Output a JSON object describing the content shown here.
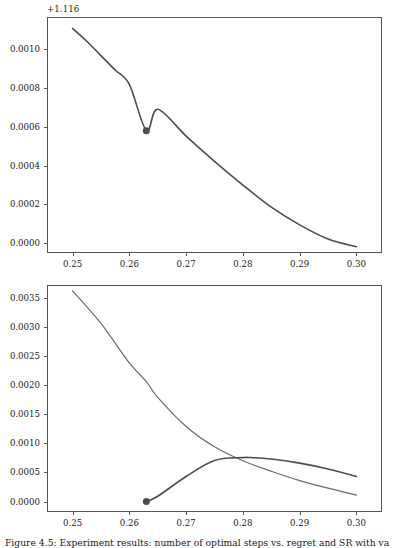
{
  "figure": {
    "caption": "Figure 4.5:  Experiment results: number of optimal steps vs. regret and SR with varying"
  },
  "chart_data": [
    {
      "id": "top-panel",
      "type": "line",
      "title": "",
      "xlabel": "",
      "ylabel": "",
      "y_offset_label": "+1.116",
      "y_offset_value": 1.116,
      "xlim": [
        0.2455,
        0.3045
      ],
      "ylim": [
        -5e-05,
        0.001165
      ],
      "grid": false,
      "legend": "none",
      "xticks": [
        0.25,
        0.26,
        0.27,
        0.28,
        0.29,
        0.3
      ],
      "xticklabels": [
        "0.25",
        "0.26",
        "0.27",
        "0.28",
        "0.29",
        "0.30"
      ],
      "yticks": [
        0.0,
        0.0002,
        0.0004,
        0.0006,
        0.0008,
        0.001
      ],
      "yticklabels": [
        "0.0000",
        "0.0002",
        "0.0004",
        "0.0006",
        "0.0008",
        "0.0010"
      ],
      "series": [
        {
          "name": "curve-1",
          "color": "#4d4d4d",
          "linewidth": 1.6,
          "x": [
            0.25,
            0.2525,
            0.255,
            0.2575,
            0.26,
            0.263,
            0.265,
            0.27,
            0.275,
            0.28,
            0.285,
            0.29,
            0.295,
            0.3
          ],
          "y": [
            0.001106,
            0.00104,
            0.000966,
            0.000892,
            0.000818,
            0.00058,
            0.00069,
            0.000552,
            0.000422,
            0.0003,
            0.000186,
            9.5e-05,
            2.2e-05,
            -1.8e-05
          ]
        }
      ],
      "markers": [
        {
          "name": "highlight-point",
          "x": 0.263,
          "y": 0.00058,
          "color": "#4d4d4d",
          "size": 7
        }
      ]
    },
    {
      "id": "bottom-panel",
      "type": "line",
      "title": "",
      "xlabel": "",
      "ylabel": "",
      "xlim": [
        0.2455,
        0.3045
      ],
      "ylim": [
        -0.00018,
        0.00372
      ],
      "grid": false,
      "legend": "none",
      "xticks": [
        0.25,
        0.26,
        0.27,
        0.28,
        0.29,
        0.3
      ],
      "xticklabels": [
        "0.25",
        "0.26",
        "0.27",
        "0.28",
        "0.29",
        "0.30"
      ],
      "yticks": [
        0.0,
        0.0005,
        0.001,
        0.0015,
        0.002,
        0.0025,
        0.003,
        0.0035
      ],
      "yticklabels": [
        "0.0000",
        "0.0005",
        "0.0010",
        "0.0015",
        "0.0020",
        "0.0025",
        "0.0030",
        "0.0035"
      ],
      "series": [
        {
          "name": "decreasing-curve",
          "color": "#6b6b6b",
          "linewidth": 1.2,
          "x": [
            0.25,
            0.255,
            0.26,
            0.263,
            0.265,
            0.27,
            0.275,
            0.28,
            0.285,
            0.29,
            0.295,
            0.3
          ],
          "y": [
            0.00362,
            0.00306,
            0.00238,
            0.00206,
            0.00179,
            0.00129,
            0.00094,
            0.0007,
            0.00052,
            0.00036,
            0.00023,
            0.00011
          ]
        },
        {
          "name": "rising-peaking-curve",
          "color": "#4d4d4d",
          "linewidth": 1.6,
          "x": [
            0.263,
            0.265,
            0.27,
            0.275,
            0.28,
            0.281,
            0.285,
            0.29,
            0.295,
            0.3
          ],
          "y": [
            0.0,
            9e-05,
            0.00043,
            0.000705,
            0.000755,
            0.000757,
            0.00073,
            0.00066,
            0.00056,
            0.00043
          ]
        }
      ],
      "markers": [
        {
          "name": "start-point",
          "x": 0.263,
          "y": 0.0,
          "color": "#4d4d4d",
          "size": 7
        }
      ]
    }
  ],
  "colors": {
    "axis": "#555555",
    "text": "#1a1a1a",
    "curve_primary": "#4d4d4d",
    "curve_secondary": "#6b6b6b",
    "background": "#ffffff"
  }
}
